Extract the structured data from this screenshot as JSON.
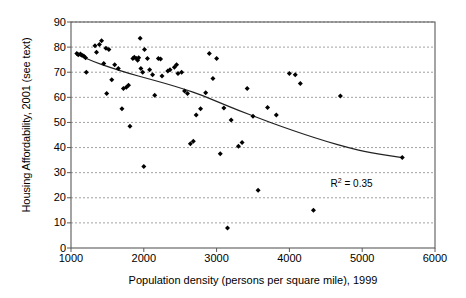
{
  "chart_data": {
    "type": "scatter",
    "title": "",
    "xlabel": "Population density (persons per square mile), 1999",
    "ylabel": "Housing Affordability, 2001 (see text)",
    "xlim": [
      1000,
      6000
    ],
    "ylim": [
      0,
      90
    ],
    "xticks": [
      1000,
      2000,
      3000,
      4000,
      5000,
      6000
    ],
    "yticks": [
      0,
      10,
      20,
      30,
      40,
      50,
      60,
      70,
      80,
      90
    ],
    "grid": "horizontal-dashed",
    "legend": "none",
    "marker": "diamond",
    "marker_color": "#000000",
    "annotations": [
      {
        "text": "R2 = 0.35",
        "display": "R",
        "sup": "2",
        "rest": " = 0.35",
        "x": 4950,
        "y": 26
      }
    ],
    "points": [
      [
        1080,
        77.5
      ],
      [
        1100,
        77.0
      ],
      [
        1130,
        77.3
      ],
      [
        1150,
        76.8
      ],
      [
        1175,
        76.5
      ],
      [
        1200,
        75.8
      ],
      [
        1210,
        70.0
      ],
      [
        1330,
        80.5
      ],
      [
        1350,
        78.0
      ],
      [
        1390,
        81.0
      ],
      [
        1420,
        82.5
      ],
      [
        1450,
        73.5
      ],
      [
        1480,
        79.5
      ],
      [
        1490,
        61.5
      ],
      [
        1520,
        79.0
      ],
      [
        1560,
        67.0
      ],
      [
        1600,
        73.0
      ],
      [
        1650,
        71.5
      ],
      [
        1700,
        55.5
      ],
      [
        1720,
        63.5
      ],
      [
        1760,
        64.0
      ],
      [
        1790,
        64.8
      ],
      [
        1810,
        48.5
      ],
      [
        1850,
        75.5
      ],
      [
        1870,
        76.0
      ],
      [
        1900,
        75.5
      ],
      [
        1915,
        74.8
      ],
      [
        1930,
        75.8
      ],
      [
        1950,
        83.5
      ],
      [
        1960,
        71.5
      ],
      [
        1985,
        70.0
      ],
      [
        2000,
        32.5
      ],
      [
        2010,
        79.0
      ],
      [
        2050,
        75.5
      ],
      [
        2080,
        71.0
      ],
      [
        2120,
        69.0
      ],
      [
        2150,
        60.8
      ],
      [
        2200,
        75.5
      ],
      [
        2230,
        75.3
      ],
      [
        2250,
        68.5
      ],
      [
        2330,
        70.5
      ],
      [
        2360,
        71.0
      ],
      [
        2420,
        72.0
      ],
      [
        2450,
        73.0
      ],
      [
        2470,
        69.5
      ],
      [
        2520,
        70.0
      ],
      [
        2560,
        62.5
      ],
      [
        2600,
        61.5
      ],
      [
        2640,
        41.5
      ],
      [
        2680,
        42.5
      ],
      [
        2720,
        53.0
      ],
      [
        2780,
        55.5
      ],
      [
        2850,
        61.8
      ],
      [
        2900,
        77.5
      ],
      [
        2950,
        67.5
      ],
      [
        3000,
        75.5
      ],
      [
        3050,
        37.5
      ],
      [
        3100,
        55.8
      ],
      [
        3150,
        8.0
      ],
      [
        3200,
        51.0
      ],
      [
        3300,
        40.5
      ],
      [
        3350,
        42.0
      ],
      [
        3420,
        63.5
      ],
      [
        3500,
        52.5
      ],
      [
        3570,
        23.0
      ],
      [
        3700,
        56.0
      ],
      [
        3820,
        53.0
      ],
      [
        4000,
        69.5
      ],
      [
        4080,
        69.0
      ],
      [
        4150,
        65.5
      ],
      [
        4330,
        15.0
      ],
      [
        4700,
        60.5
      ],
      [
        5550,
        36.0
      ]
    ],
    "trend": {
      "kind": "fitted-curve",
      "r_squared": 0.35,
      "path": [
        [
          1090,
          77.0
        ],
        [
          1300,
          74.3
        ],
        [
          1550,
          71.8
        ],
        [
          1800,
          69.5
        ],
        [
          2050,
          67.5
        ],
        [
          2300,
          65.5
        ],
        [
          2550,
          63.3
        ],
        [
          2800,
          60.8
        ],
        [
          3050,
          57.8
        ],
        [
          3300,
          54.8
        ],
        [
          3600,
          51.5
        ],
        [
          3900,
          48.3
        ],
        [
          4200,
          45.3
        ],
        [
          4500,
          42.5
        ],
        [
          4800,
          40.0
        ],
        [
          5100,
          38.0
        ],
        [
          5550,
          36.0
        ]
      ]
    }
  },
  "axis": {
    "x_tick_labels": [
      "1000",
      "2000",
      "3000",
      "4000",
      "5000",
      "6000"
    ],
    "y_tick_labels": [
      "0",
      "10",
      "20",
      "30",
      "40",
      "50",
      "60",
      "70",
      "80",
      "90"
    ],
    "x_title": "Population density (persons per square mile), 1999",
    "y_title": "Housing Affordability, 2001 (see text)"
  },
  "annotation": {
    "r2_prefix": "R",
    "r2_sup": "2",
    "r2_value": " = 0.35"
  },
  "colors": {
    "marker": "#000000",
    "trendline": "#222222",
    "gridline": "#8a8a8a",
    "axis": "#5a5a5a",
    "background": "#ffffff"
  }
}
